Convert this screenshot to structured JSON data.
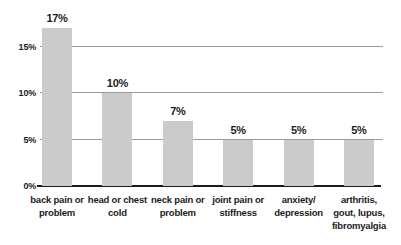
{
  "chart_data": {
    "type": "bar",
    "title": "",
    "xlabel": "",
    "ylabel": "",
    "categories": [
      "back pain or\nproblem",
      "head or chest\ncold",
      "neck pain or\nproblem",
      "joint pain or\nstiffness",
      "anxiety/\ndepression",
      "arthritis,\ngout, lupus,\nfibromyalgia"
    ],
    "values": [
      17,
      10,
      7,
      5,
      5,
      5
    ],
    "value_labels": [
      "17%",
      "10%",
      "7%",
      "5%",
      "5%",
      "5%"
    ],
    "ylim": [
      0,
      20
    ],
    "yticks": [
      0,
      5,
      10,
      15
    ],
    "ytick_labels": [
      "0%",
      "5%",
      "10%",
      "15%"
    ],
    "grid": true,
    "legend": false,
    "colors": {
      "bar": "#cbcbcb",
      "gridline": "#9b9b9b",
      "axis": "#1b1b1b",
      "text": "#1b1b1b",
      "background": "#ffffff"
    }
  }
}
